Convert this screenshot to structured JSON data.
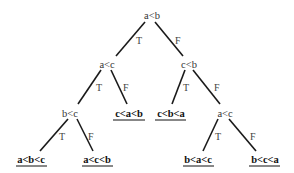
{
  "diagram": {
    "type": "decision-tree",
    "colors": {
      "line": "#1a1a1a",
      "text": "#333333",
      "leaf_text": "#111111",
      "background": "#ffffff"
    },
    "nodes": {
      "root": {
        "label": "a<b",
        "x": 152,
        "y": 18
      },
      "n_ac": {
        "label": "a<c",
        "x": 107,
        "y": 67
      },
      "n_cb": {
        "label": "c<b",
        "x": 190,
        "y": 67
      },
      "n_bc": {
        "label": "b<c",
        "x": 70,
        "y": 115
      },
      "n_ac2": {
        "label": "a<c",
        "x": 225,
        "y": 115
      }
    },
    "leaves": {
      "l_cab": {
        "label": "c<a<b",
        "x": 127,
        "y": 115
      },
      "l_cba": {
        "label": "c<b<a",
        "x": 170,
        "y": 115
      },
      "l_abc": {
        "label": "a<b<c",
        "x": 31,
        "y": 161
      },
      "l_acb": {
        "label": "a<c<b",
        "x": 97,
        "y": 161
      },
      "l_bac": {
        "label": "b<a<c",
        "x": 197,
        "y": 161
      },
      "l_bca": {
        "label": "b<c<a",
        "x": 264,
        "y": 161
      }
    },
    "edges": [
      {
        "from": "root",
        "to": "n_ac",
        "label": "T"
      },
      {
        "from": "root",
        "to": "n_cb",
        "label": "F"
      },
      {
        "from": "n_ac",
        "to": "n_bc",
        "label": "T"
      },
      {
        "from": "n_ac",
        "to": "l_cab",
        "label": "F"
      },
      {
        "from": "n_cb",
        "to": "l_cba",
        "label": "T"
      },
      {
        "from": "n_cb",
        "to": "n_ac2",
        "label": "F"
      },
      {
        "from": "n_bc",
        "to": "l_abc",
        "label": "T"
      },
      {
        "from": "n_bc",
        "to": "l_acb",
        "label": "F"
      },
      {
        "from": "n_ac2",
        "to": "l_bac",
        "label": "T"
      },
      {
        "from": "n_ac2",
        "to": "l_bca",
        "label": "F"
      }
    ]
  }
}
